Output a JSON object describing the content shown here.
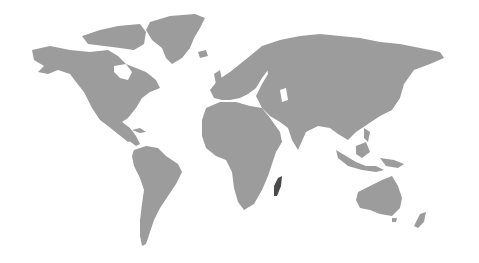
{
  "map": {
    "type": "world-map",
    "projection": "equirectangular-ish",
    "background_color": "#ffffff",
    "land_color": "#9c9c9c",
    "highlight_color": "#4a4a4a",
    "highlighted_regions": [
      {
        "name": "Madagascar",
        "color": "#4a4a4a"
      }
    ],
    "continents": [
      "North America",
      "Greenland",
      "South America",
      "Europe",
      "Africa",
      "Asia",
      "Australia",
      "New Zealand"
    ]
  }
}
